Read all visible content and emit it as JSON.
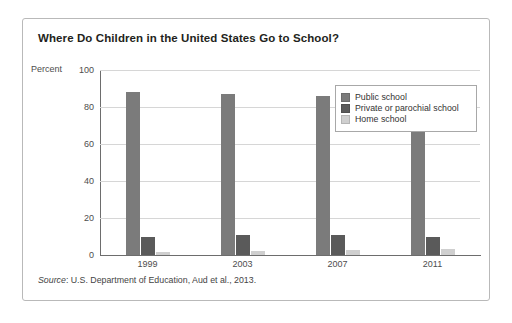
{
  "figure": {
    "title": "Where Do Children in the United States Go to School?",
    "source_prefix": "Source",
    "source_text": ": U.S. Department of Education, Aud et al., 2013."
  },
  "chart_data": {
    "type": "bar",
    "title": "Where Do Children in the United States Go to School?",
    "xlabel": "",
    "ylabel": "Percent",
    "ylim": [
      0,
      100
    ],
    "yticks": [
      0,
      20,
      40,
      60,
      80,
      100
    ],
    "grid": true,
    "legend_position": "inside-right",
    "categories": [
      "1999",
      "2003",
      "2007",
      "2011"
    ],
    "series": [
      {
        "name": "Public school",
        "color": "#7b7b7b",
        "values": [
          88,
          87,
          86,
          88
        ]
      },
      {
        "name": "Private or parochial school",
        "color": "#5a5a5a",
        "values": [
          10,
          11,
          11,
          10
        ]
      },
      {
        "name": "Home school",
        "color": "#cfcfcf",
        "values": [
          1.7,
          2.2,
          2.9,
          3.0
        ]
      }
    ]
  }
}
